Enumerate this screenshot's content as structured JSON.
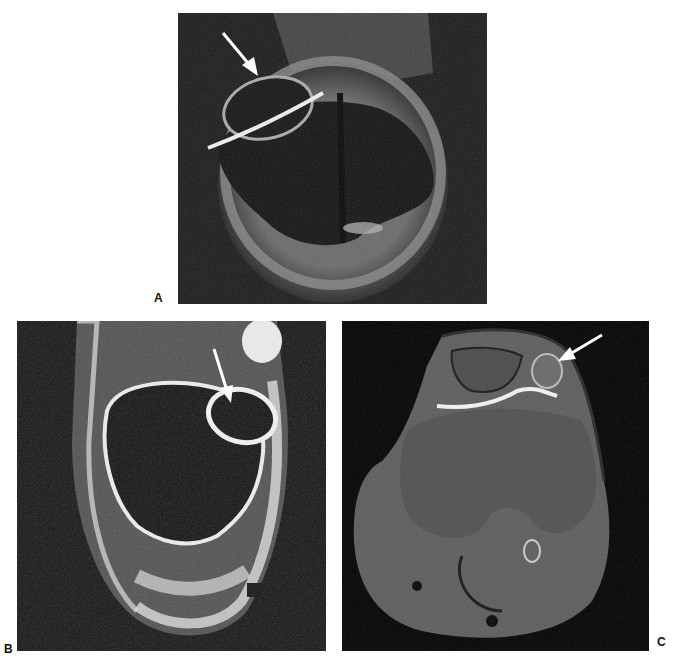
{
  "figure": {
    "panels": [
      {
        "id": "A",
        "label": "A",
        "content": "Grayscale MRI image, oblique view with oval bony structure and bright rim; white arrow pointing to small upper-left oval region",
        "arrow": "white arrow pointing down-right toward upper-left oval structure"
      },
      {
        "id": "B",
        "label": "B",
        "content": "Grayscale MRI image, bright high-signal outline around large dark central structure with small oval at upper right",
        "arrow": "white arrow pointing down toward small upper-right oval structure"
      },
      {
        "id": "C",
        "label": "C",
        "content": "Grayscale axial MRI of the knee with patella at top and femoral condyles in center",
        "arrow": "white arrow pointing down-left toward small nodule at upper right of patella"
      }
    ]
  },
  "colors": {
    "background": "#ffffff",
    "image_dark": "#141414",
    "signal_bright": "#e8e8e8",
    "arrow": "#ffffff",
    "label": "#111111"
  }
}
